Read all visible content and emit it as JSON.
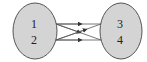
{
  "diagram": {
    "type": "mapping",
    "left_set": {
      "elements": [
        "1",
        "2"
      ],
      "fill": "#d4d4d4",
      "stroke": "#555555"
    },
    "right_set": {
      "elements": [
        "3",
        "4"
      ],
      "fill": "#d4d4d4",
      "stroke": "#555555"
    },
    "arrows": [
      {
        "from": "1",
        "to": "3"
      },
      {
        "from": "1",
        "to": "4"
      },
      {
        "from": "2",
        "to": "3"
      },
      {
        "from": "2",
        "to": "4"
      }
    ]
  }
}
